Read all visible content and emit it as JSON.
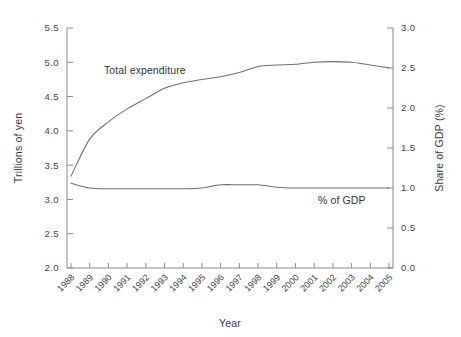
{
  "chart_data": {
    "type": "line",
    "title": "",
    "xlabel": "Year",
    "ylabel": "Trillions of yen",
    "y2label": "Share of GDP (%)",
    "grid": false,
    "legend_position": "inline-annotation",
    "x": [
      1988,
      1989,
      1990,
      1991,
      1992,
      1993,
      1994,
      1995,
      1996,
      1997,
      1998,
      1999,
      2000,
      2001,
      2002,
      2003,
      2004,
      2005
    ],
    "categories": [
      "1988",
      "1989",
      "1990",
      "1991",
      "1992",
      "1993",
      "1994",
      "1995",
      "1996",
      "1997",
      "1998",
      "1999",
      "2000",
      "2001",
      "2002",
      "2003",
      "2004",
      "2005"
    ],
    "ylim": [
      2.0,
      5.5
    ],
    "yticks": [
      "2.0",
      "2.5",
      "3.0",
      "3.5",
      "4.0",
      "4.5",
      "5.0",
      "5.5"
    ],
    "y2lim": [
      0.0,
      3.0
    ],
    "y2ticks": [
      "0.0",
      "0.5",
      "1.0",
      "1.5",
      "2.0",
      "2.5",
      "3.0"
    ],
    "series": [
      {
        "name": "Total expenditure",
        "axis": "left",
        "units": "Trillions of yen",
        "values": [
          3.34,
          3.88,
          4.13,
          4.32,
          4.47,
          4.62,
          4.7,
          4.75,
          4.79,
          4.85,
          4.94,
          4.96,
          4.97,
          5.0,
          5.01,
          5.0,
          4.96,
          4.92
        ]
      },
      {
        "name": "% of GDP",
        "axis": "right",
        "units": "Share of GDP (%)",
        "values": [
          1.06,
          1.0,
          0.99,
          0.99,
          0.99,
          0.99,
          0.99,
          1.0,
          1.04,
          1.04,
          1.04,
          1.01,
          1.0,
          1.0,
          1.0,
          1.0,
          1.0,
          1.0
        ]
      }
    ],
    "annotations": [
      {
        "text": "Total expenditure",
        "x_px": 104,
        "y_px": 74
      },
      {
        "text": "% of GDP",
        "x_px": 318,
        "y_px": 204
      }
    ]
  },
  "axes": {
    "left_title": "Trillions of yen",
    "right_title": "Share of GDP (%)",
    "bottom_title": "Year"
  }
}
